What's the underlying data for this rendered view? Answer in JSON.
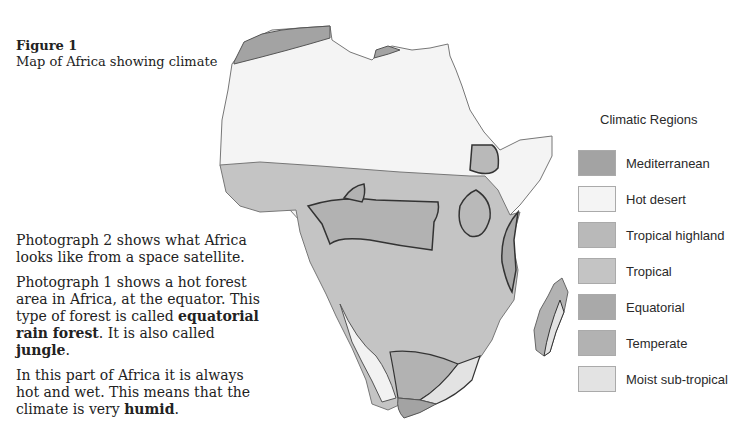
{
  "figure": {
    "label": "Figure 1",
    "title": "Map of Africa showing climate"
  },
  "body": {
    "p1": "Photograph 2 shows what Africa looks like from a space satellite.",
    "p2_start": "Photograph 1 shows a hot forest area in Africa, at the equator. This type of forest is called ",
    "p2_bold1": "equatorial rain forest",
    "p2_mid": ". It is also called ",
    "p2_bold2": "jungle",
    "p2_end": ".",
    "p3_start": "In this part of Africa it is always hot and wet. This means that the climate is very ",
    "p3_bold": "humid",
    "p3_end": "."
  },
  "legend": {
    "title": "Climatic Regions",
    "items": [
      {
        "label": "Mediterranean",
        "color": "#a3a3a3"
      },
      {
        "label": "Hot desert",
        "color": "#f4f4f4"
      },
      {
        "label": "Tropical highland",
        "color": "#b9b9b9"
      },
      {
        "label": "Tropical",
        "color": "#c4c4c4"
      },
      {
        "label": "Equatorial",
        "color": "#a9a9a9"
      },
      {
        "label": "Temperate",
        "color": "#b2b2b2"
      },
      {
        "label": "Moist sub-tropical",
        "color": "#e3e3e3"
      }
    ]
  }
}
